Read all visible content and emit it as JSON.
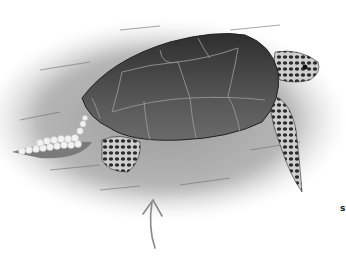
{
  "illustration": {
    "subject": "sea-turtle-laying-eggs",
    "elements": [
      "sand-mound",
      "turtle-shell",
      "turtle-head",
      "front-flipper",
      "rear-flipper",
      "egg-clutch",
      "arrow-up"
    ]
  },
  "edge_text": "s",
  "colors": {
    "background": "#ffffff",
    "sand": "#b8b8b8",
    "shell": "#4a4a4a",
    "shell_seams": "#9a9a9a",
    "eggs": "#f2f2f2",
    "arrow": "#8a8a8a"
  }
}
